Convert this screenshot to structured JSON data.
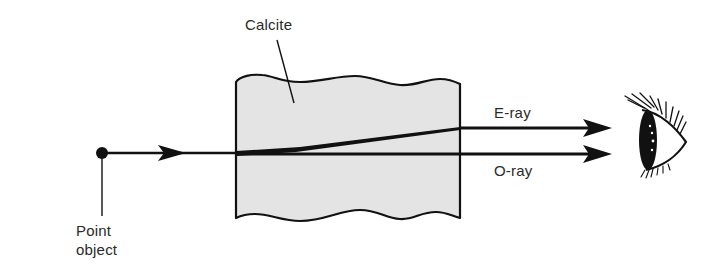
{
  "diagram": {
    "type": "optics-birefringence",
    "labels": {
      "crystal": "Calcite",
      "extraordinary_ray": "E-ray",
      "ordinary_ray": "O-ray",
      "source_line1": "Point",
      "source_line2": "object"
    },
    "elements": [
      {
        "name": "point-object",
        "shape": "dot"
      },
      {
        "name": "incident-ray",
        "shape": "arrow-line"
      },
      {
        "name": "calcite-crystal",
        "shape": "wavy-edged block"
      },
      {
        "name": "e-ray",
        "shape": "arrow-line",
        "deflected": true
      },
      {
        "name": "o-ray",
        "shape": "arrow-line",
        "deflected": false
      },
      {
        "name": "observer-eye",
        "shape": "eye"
      }
    ],
    "colors": {
      "line": "#111111",
      "crystal_fill": "#e4e4e4",
      "text": "#2a2a2a",
      "background": "#ffffff"
    }
  }
}
